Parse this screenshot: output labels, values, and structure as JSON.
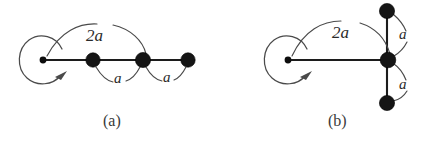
{
  "figure": {
    "background_color": "#ffffff",
    "ink_color": "#1c1c1c",
    "arc_color": "#4a4a4a",
    "width": 427,
    "height": 152,
    "panels": [
      {
        "id": "panel-a",
        "caption": "(a)",
        "caption_x": 115,
        "caption_y": 122,
        "description": "horizontal chain of four vertices with self-loop at the left endpoint",
        "root_dot": {
          "x": 43,
          "y": 60,
          "r": 3.4
        },
        "nodes": [
          {
            "id": "a-node-1",
            "x": 93,
            "y": 60,
            "r": 7.2
          },
          {
            "id": "a-node-2",
            "x": 143,
            "y": 60,
            "r": 7.6
          },
          {
            "id": "a-node-3",
            "x": 188,
            "y": 60,
            "r": 7.2
          }
        ],
        "spine": {
          "x1": 43,
          "y1": 60,
          "x2": 188,
          "y2": 60
        },
        "self_loop": {
          "center_x": 43,
          "center_y": 60,
          "radius": 22,
          "arrow_tip_x": 66,
          "arrow_tip_y": 74
        },
        "arcs": [
          {
            "id": "a-arc-2a",
            "label": "2a",
            "label_x": 95,
            "label_y": 35,
            "from_x": 47,
            "from_y": 56,
            "to_x": 146,
            "to_y": 54,
            "apex_x": 97,
            "apex_y": 24
          },
          {
            "id": "a-arc-a-1",
            "label": "a",
            "label_x": 118,
            "label_y": 78,
            "from_x": 96,
            "from_y": 66,
            "to_x": 140,
            "to_y": 67,
            "apex_x": 118,
            "apex_y": 84
          },
          {
            "id": "a-arc-a-2",
            "label": "a",
            "label_x": 167,
            "label_y": 77,
            "from_x": 146,
            "from_y": 66,
            "to_x": 186,
            "to_y": 67,
            "apex_x": 166,
            "apex_y": 83
          }
        ]
      },
      {
        "id": "panel-b",
        "caption": "(b)",
        "caption_x": 340,
        "caption_y": 122,
        "description": "star of three vertices about a hub with self-loop at the left endpoint",
        "root_dot": {
          "x": 288,
          "y": 60,
          "r": 3.4
        },
        "nodes": [
          {
            "id": "b-node-top",
            "x": 387,
            "y": 11,
            "r": 7.6
          },
          {
            "id": "b-node-hub",
            "x": 388,
            "y": 60,
            "r": 7.8
          },
          {
            "id": "b-node-bottom",
            "x": 387,
            "y": 103,
            "r": 7.6
          }
        ],
        "spine": {
          "x1": 288,
          "y1": 60,
          "x2": 388,
          "y2": 60
        },
        "stem": {
          "x1": 387,
          "y1": 11,
          "x2": 387,
          "y2": 103
        },
        "self_loop": {
          "center_x": 288,
          "center_y": 60,
          "radius": 22,
          "arrow_tip_x": 311,
          "arrow_tip_y": 74
        },
        "arcs": [
          {
            "id": "b-arc-2a",
            "label": "2a",
            "label_x": 340,
            "label_y": 32,
            "from_x": 292,
            "from_y": 56,
            "to_x": 390,
            "to_y": 54,
            "apex_x": 342,
            "apex_y": 21
          },
          {
            "id": "b-arc-a-top",
            "label": "a",
            "label_x": 402,
            "label_y": 34,
            "from_x": 393,
            "from_y": 14,
            "to_x": 394,
            "to_y": 56,
            "apex_x": 411,
            "apex_y": 35
          },
          {
            "id": "b-arc-a-bottom",
            "label": "a",
            "label_x": 402,
            "label_y": 84,
            "from_x": 394,
            "from_y": 64,
            "to_x": 393,
            "to_y": 100,
            "apex_x": 411,
            "apex_y": 83
          }
        ]
      }
    ]
  }
}
